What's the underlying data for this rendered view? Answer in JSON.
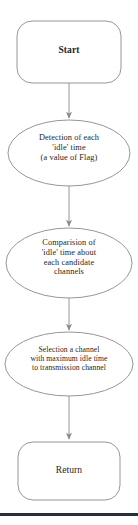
{
  "diagram": {
    "background_color": "#ffffff",
    "stroke_color": "#7a7a7a",
    "text_color": "#262626",
    "rule_color": "#2b2f36",
    "nodes": [
      {
        "id": "start",
        "shape": "rounded-rectangle",
        "label": "Start",
        "bold": true,
        "x": 17,
        "y": 21,
        "width": 104,
        "height": 62,
        "radius": 14
      },
      {
        "id": "detection",
        "shape": "ellipse",
        "label": "Detection of each\n'idle' time\n(a value of Flag)",
        "bold": false,
        "cx": 69,
        "cy": 153,
        "rx": 61,
        "ry": 33
      },
      {
        "id": "comparison",
        "shape": "ellipse",
        "label": "Comparision of\n'idle' time about\neach candidate\nchannels",
        "bold": false,
        "cx": 69,
        "cy": 263,
        "rx": 63,
        "ry": 35
      },
      {
        "id": "selection",
        "shape": "ellipse",
        "label": "Selection a channel\nwith maximum idle time\nto transmission channel",
        "bold": false,
        "cx": 69,
        "cy": 364,
        "rx": 64,
        "ry": 32
      },
      {
        "id": "return",
        "shape": "rounded-rectangle",
        "label": "Return",
        "bold": false,
        "x": 18,
        "y": 442,
        "width": 102,
        "height": 58,
        "radius": 14
      }
    ],
    "connectors": [
      {
        "id": "start-to-detection",
        "from": "start",
        "to": "detection",
        "x": 69,
        "y1": 83,
        "y2": 119
      },
      {
        "id": "detection-to-comparison",
        "from": "detection",
        "to": "comparison",
        "x": 69,
        "y1": 186,
        "y2": 227
      },
      {
        "id": "comparison-to-selection",
        "from": "comparison",
        "to": "selection",
        "x": 69,
        "y1": 298,
        "y2": 331
      },
      {
        "id": "selection-to-return",
        "from": "selection",
        "to": "return",
        "x": 69,
        "y1": 396,
        "y2": 440
      }
    ],
    "bottom_rule": {
      "y": 513,
      "height": 3
    }
  }
}
